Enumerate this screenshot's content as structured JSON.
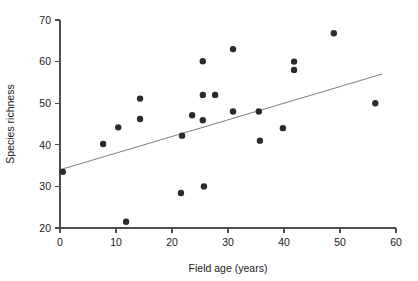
{
  "chart_data": {
    "type": "scatter",
    "title": "",
    "xlabel": "Field age (years)",
    "ylabel": "Species richness",
    "xlim": [
      0,
      60
    ],
    "ylim": [
      20,
      70
    ],
    "xticks": [
      0,
      10,
      20,
      30,
      40,
      50,
      60
    ],
    "yticks": [
      20,
      30,
      40,
      50,
      60,
      70
    ],
    "xtick_labels": [
      "0",
      "10",
      "20",
      "30",
      "40",
      "50",
      "60"
    ],
    "ytick_labels": [
      "20",
      "30",
      "40",
      "50",
      "60",
      "70"
    ],
    "grid": false,
    "legend": "none",
    "series": [
      {
        "name": "Fields",
        "marker": "filled-circle",
        "color": "#2b2b2b",
        "points": [
          {
            "x": 0.5,
            "y": 33.5
          },
          {
            "x": 7.7,
            "y": 40.2
          },
          {
            "x": 10.4,
            "y": 44.2
          },
          {
            "x": 11.8,
            "y": 21.5
          },
          {
            "x": 14.3,
            "y": 51.1
          },
          {
            "x": 14.3,
            "y": 46.2
          },
          {
            "x": 21.6,
            "y": 28.4
          },
          {
            "x": 21.8,
            "y": 42.2
          },
          {
            "x": 23.6,
            "y": 47.1
          },
          {
            "x": 25.7,
            "y": 30.0
          },
          {
            "x": 25.5,
            "y": 60.1
          },
          {
            "x": 25.5,
            "y": 45.9
          },
          {
            "x": 25.5,
            "y": 52.0
          },
          {
            "x": 27.7,
            "y": 52.0
          },
          {
            "x": 30.9,
            "y": 63.0
          },
          {
            "x": 30.9,
            "y": 48.0
          },
          {
            "x": 35.5,
            "y": 48.0
          },
          {
            "x": 35.7,
            "y": 41.0
          },
          {
            "x": 39.8,
            "y": 44.0
          },
          {
            "x": 41.8,
            "y": 60.0
          },
          {
            "x": 41.8,
            "y": 58.0
          },
          {
            "x": 48.9,
            "y": 66.8
          },
          {
            "x": 56.3,
            "y": 50.0
          }
        ]
      }
    ],
    "trend_line": {
      "name": "regression-line",
      "color": "#6e6e6e",
      "x_start": 0.0,
      "y_start": 34.0,
      "x_end": 57.5,
      "y_end": 57.0
    },
    "markers": {
      "radius_px": 3.2
    }
  },
  "axes": {
    "x_axis_name": "x-axis",
    "y_axis_name": "y-axis"
  }
}
